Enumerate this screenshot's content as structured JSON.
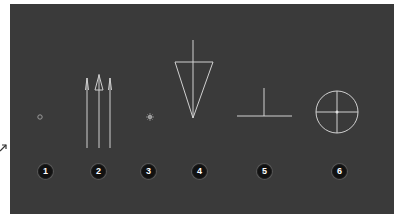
{
  "figure": {
    "background_color": "#3a3a3a",
    "line_color": "#d8d8d8",
    "badge_color": "#111111",
    "symbols": [
      {
        "index": 0,
        "label": "1",
        "shape": "small-circle-dot"
      },
      {
        "index": 1,
        "label": "2",
        "shape": "three-arrows-up"
      },
      {
        "index": 2,
        "label": "3",
        "shape": "small-star-dot"
      },
      {
        "index": 3,
        "label": "4",
        "shape": "inverted-triangle-with-vertical-line"
      },
      {
        "index": 4,
        "label": "5",
        "shape": "inverted-t"
      },
      {
        "index": 5,
        "label": "6",
        "shape": "circle-crosshair"
      }
    ]
  }
}
